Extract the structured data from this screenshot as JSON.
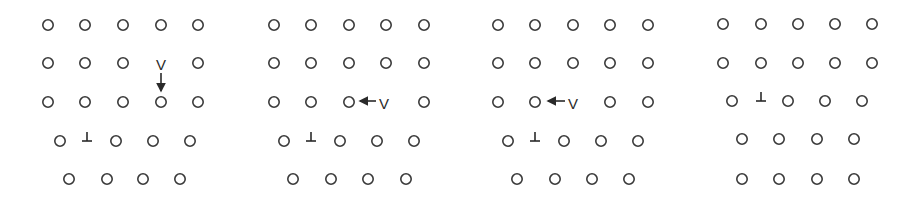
{
  "figure": {
    "colors": {
      "atom_stroke": "#3a3a3a",
      "symbol": "#2a2a2a",
      "background": "#ffffff"
    },
    "symbols": {
      "vacancy": "V",
      "dislocation": "⊥"
    },
    "panels": [
      {
        "id": 1,
        "rows": [
          {
            "y": 25,
            "atoms": [
              48,
              85,
              123,
              161,
              198
            ]
          },
          {
            "y": 63,
            "atoms": [
              48,
              85,
              123,
              198
            ],
            "vacancy": {
              "x": 161,
              "y": 64
            }
          },
          {
            "y": 102,
            "atoms": [
              48,
              85,
              123,
              161,
              198
            ]
          },
          {
            "y": 141,
            "atoms": [
              60,
              116,
              153,
              190
            ],
            "dislocation": {
              "x": 87,
              "y": 138
            }
          },
          {
            "y": 179,
            "atoms": [
              69,
              107,
              143,
              180
            ]
          }
        ],
        "arrow": {
          "x1": 161,
          "y1": 73,
          "x2": 161,
          "y2": 91,
          "direction": "down"
        }
      },
      {
        "id": 2,
        "rows": [
          {
            "y": 25,
            "atoms": [
              274,
              311,
              349,
              386,
              424
            ]
          },
          {
            "y": 63,
            "atoms": [
              274,
              311,
              349,
              386,
              424
            ]
          },
          {
            "y": 102,
            "atoms": [
              274,
              311,
              349,
              424
            ],
            "vacancy": {
              "x": 384,
              "y": 103
            }
          },
          {
            "y": 141,
            "atoms": [
              284,
              340,
              377,
              414
            ],
            "dislocation": {
              "x": 311,
              "y": 138
            }
          },
          {
            "y": 179,
            "atoms": [
              293,
              331,
              368,
              406
            ]
          }
        ],
        "arrow": {
          "x1": 376,
          "y1": 101,
          "x2": 360,
          "y2": 101,
          "direction": "left"
        }
      },
      {
        "id": 3,
        "rows": [
          {
            "y": 25,
            "atoms": [
              498,
              535,
              573,
              610,
              648
            ]
          },
          {
            "y": 63,
            "atoms": [
              498,
              535,
              573,
              610,
              648
            ]
          },
          {
            "y": 102,
            "atoms": [
              498,
              535,
              610,
              648
            ],
            "vacancy": {
              "x": 573,
              "y": 103
            }
          },
          {
            "y": 141,
            "atoms": [
              508,
              564,
              601,
              638
            ],
            "dislocation": {
              "x": 535,
              "y": 138
            }
          },
          {
            "y": 179,
            "atoms": [
              517,
              555,
              592,
              629
            ]
          }
        ],
        "arrow": {
          "x1": 565,
          "y1": 101,
          "x2": 548,
          "y2": 101,
          "direction": "left"
        }
      },
      {
        "id": 4,
        "rows": [
          {
            "y": 24,
            "atoms": [
              723,
              761,
              798,
              835,
              872
            ]
          },
          {
            "y": 63,
            "atoms": [
              723,
              761,
              798,
              835,
              872
            ]
          },
          {
            "y": 101,
            "atoms": [
              732,
              788,
              825,
              862
            ],
            "dislocation": {
              "x": 761,
              "y": 98
            }
          },
          {
            "y": 139,
            "atoms": [
              742,
              779,
              817,
              854
            ]
          },
          {
            "y": 179,
            "atoms": [
              742,
              779,
              817,
              854
            ]
          }
        ]
      }
    ]
  }
}
